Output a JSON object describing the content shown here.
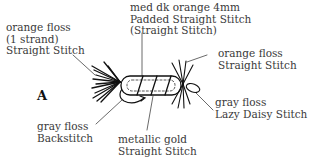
{
  "figure": {
    "letter": "A"
  },
  "labels": {
    "tail": {
      "lines": [
        "orange floss",
        "(1 strand)",
        "Straight Stitch"
      ]
    },
    "body": {
      "lines": [
        "med dk orange  4mm",
        "Padded Straight Stitch",
        "(Straight Stitch)"
      ]
    },
    "head": {
      "lines": [
        "orange floss",
        "Straight Stitch"
      ]
    },
    "hook_outline": {
      "lines": [
        "gray floss",
        "Backstitch"
      ]
    },
    "body_wrap": {
      "lines": [
        "metallic gold",
        "Straight Stitch"
      ]
    },
    "eye": {
      "lines": [
        "gray floss",
        "Lazy Daisy Stitch"
      ]
    }
  }
}
